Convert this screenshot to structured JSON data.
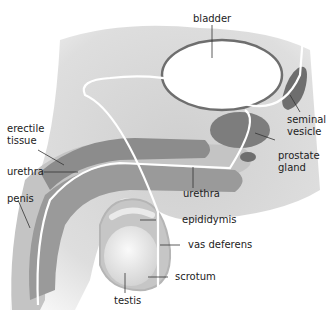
{
  "diagram": {
    "labels": {
      "bladder": "bladder",
      "seminal_vesicle_line1": "seminal",
      "seminal_vesicle_line2": "vesicle",
      "prostate_line1": "prostate",
      "prostate_line2": "gland",
      "erectile_line1": "erectile",
      "erectile_line2": "tissue",
      "urethra_left": "urethra",
      "urethra_right": "urethra",
      "penis": "penis",
      "epididymis": "epididymis",
      "vas_deferens": "vas deferens",
      "scrotum": "scrotum",
      "testis": "testis"
    },
    "colors": {
      "body": "#d9d9d9",
      "tissue": "#8c8c8c",
      "organ_dark": "#6e6e6e",
      "duct": "#ffffff",
      "leader": "#333333"
    }
  }
}
